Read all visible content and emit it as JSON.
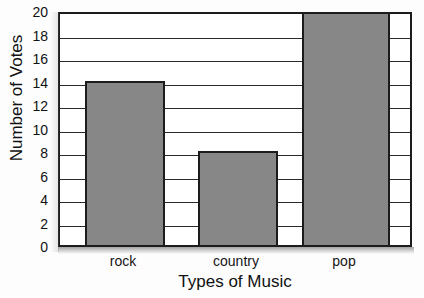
{
  "chart_data": {
    "type": "bar",
    "title": "Favorite Music",
    "xlabel": "Types of Music",
    "ylabel": "Number of Votes",
    "categories": [
      "rock",
      "country",
      "pop"
    ],
    "values": [
      14,
      8,
      20
    ],
    "ylim": [
      0,
      20
    ],
    "ytick_step": 2,
    "yticks": [
      0,
      2,
      4,
      6,
      8,
      10,
      12,
      14,
      16,
      18,
      20
    ],
    "ytick_labels": [
      "0",
      "2",
      "4",
      "6",
      "8",
      "10",
      "12",
      "14",
      "16",
      "18",
      "20"
    ],
    "grid": true,
    "grid_orientation": "horizontal",
    "legend": false,
    "legend_position": "none",
    "bar_color": "#878787",
    "bar_border_color": "#1c1c1c",
    "axis_color": "#1c1c1c",
    "title_clipped": true
  },
  "labels": {
    "title": "Favorite Music",
    "y_axis": "Number of Votes",
    "x_axis": "Types of Music"
  }
}
